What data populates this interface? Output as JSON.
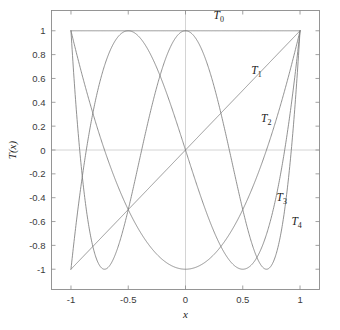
{
  "chart_data": {
    "type": "line",
    "title": "",
    "subtitle": "",
    "xlabel": "x",
    "ylabel": "T(x)",
    "xlim": [
      -1.17,
      1.17
    ],
    "ylim": [
      -1.17,
      1.17
    ],
    "xticks": [
      -1,
      -0.5,
      0,
      0.5,
      1
    ],
    "xticklabels": [
      "-1",
      "-0.5",
      "0",
      "0.5",
      "1"
    ],
    "yticks": [
      1,
      0.8,
      0.6,
      0.4,
      0.2,
      0,
      -0.2,
      -0.4,
      -0.6,
      -0.8,
      -1
    ],
    "yticklabels": [
      "1",
      "0.8",
      "0.6",
      "0.4",
      "0.2",
      "0",
      "-0.2",
      "-0.4",
      "-0.6",
      "-0.8",
      "-1"
    ],
    "grid": false,
    "legend": "inline-annotations",
    "curve_color": "#7d7d7d",
    "axis_color": "#8a8a8a",
    "zeroline_color": "#c9c9c9",
    "domain": [
      -1,
      1
    ],
    "series": [
      {
        "name": "T_0",
        "label": "T",
        "subscript": "0",
        "formula": "1",
        "degree": 0,
        "label_x": 0.245,
        "label_y": 1.1,
        "roots": [],
        "endpoint_values": [
          1,
          1
        ]
      },
      {
        "name": "T_1",
        "label": "T",
        "subscript": "1",
        "formula": "x",
        "degree": 1,
        "label_x": 0.575,
        "label_y": 0.635,
        "roots": [
          0
        ],
        "endpoint_values": [
          -1,
          1
        ]
      },
      {
        "name": "T_2",
        "label": "T",
        "subscript": "2",
        "formula": "2x^2 - 1",
        "degree": 2,
        "label_x": 0.66,
        "label_y": 0.235,
        "roots": [
          -0.7071,
          0.7071
        ],
        "endpoint_values": [
          1,
          1
        ]
      },
      {
        "name": "T_3",
        "label": "T",
        "subscript": "3",
        "formula": "4x^3 - 3x",
        "degree": 3,
        "label_x": 0.795,
        "label_y": -0.425,
        "roots": [
          -0.866,
          0,
          0.866
        ],
        "endpoint_values": [
          -1,
          1
        ]
      },
      {
        "name": "T_4",
        "label": "T",
        "subscript": "4",
        "formula": "8x^4 - 8x^2 + 1",
        "degree": 4,
        "label_x": 0.925,
        "label_y": -0.63,
        "roots": [
          -0.9239,
          -0.3827,
          0.3827,
          0.9239
        ],
        "endpoint_values": [
          1,
          1
        ]
      }
    ]
  }
}
